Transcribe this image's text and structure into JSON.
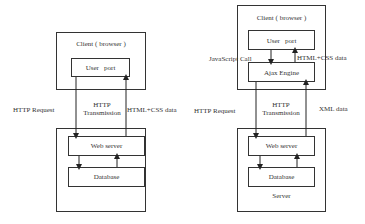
{
  "left_diagram": {
    "client_box": {
      "label": "Client ( browser )"
    },
    "user_port": {
      "label": "User   port"
    },
    "server_box": {},
    "web_server": {
      "label": "Web server"
    },
    "database": {
      "label": "Database"
    },
    "edge_labels": {
      "request": "HTTP Request",
      "transmission_line1": "HTTP",
      "transmission_line2": "Transmission",
      "response": "HTML+CSS data"
    }
  },
  "right_diagram": {
    "client_box": {
      "label": "Client ( browser )"
    },
    "user_port": {
      "label": "User   port"
    },
    "ajax_engine": {
      "label": "Ajax Engine"
    },
    "server_box": {
      "label": "Server"
    },
    "web_server": {
      "label": "Web server"
    },
    "database": {
      "label": "Database"
    },
    "edge_labels": {
      "js_call": "JavaScript Call",
      "html_css": "HTML+CSS data",
      "request": "HTTP Request",
      "transmission_line1": "HTTP",
      "transmission_line2": "Transmission",
      "response": "XML data"
    }
  },
  "colors": {
    "line": "#222222",
    "background": "#ffffff"
  }
}
